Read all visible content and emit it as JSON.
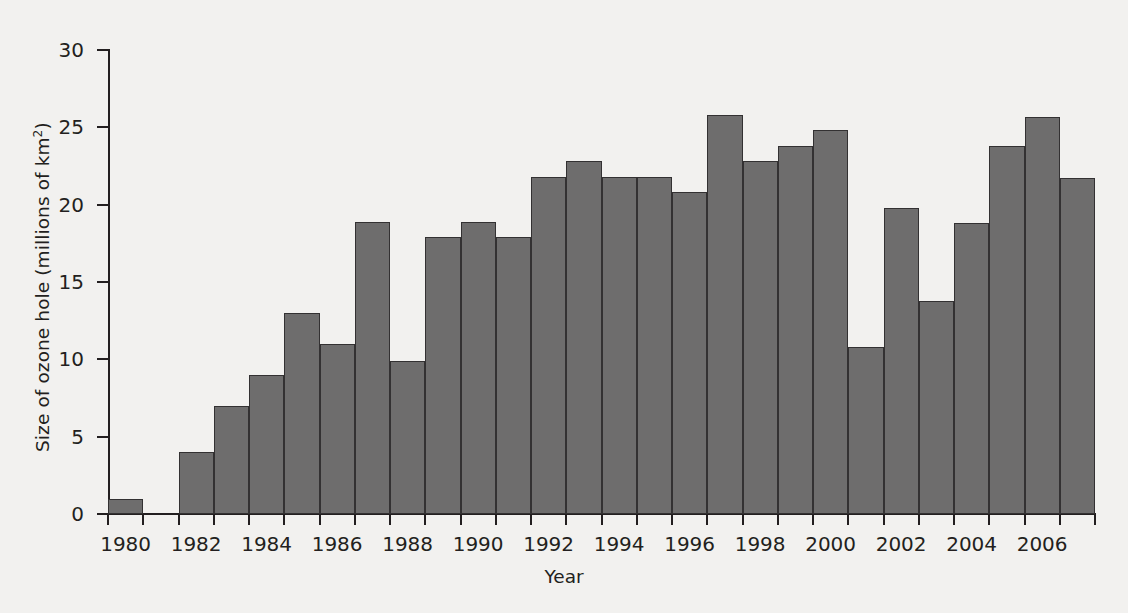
{
  "chart_data": {
    "type": "bar",
    "title": "",
    "xlabel": "Year",
    "ylabel": "Size of ozone hole (millions of km²)",
    "ylabel_main": "Size of ozone hole (millions of km",
    "ylabel_sup": "2",
    "ylabel_tail": ")",
    "categories": [
      1980,
      1981,
      1982,
      1983,
      1984,
      1985,
      1986,
      1987,
      1988,
      1989,
      1990,
      1991,
      1992,
      1993,
      1994,
      1995,
      1996,
      1997,
      1998,
      1999,
      2000,
      2001,
      2002,
      2003,
      2004,
      2005,
      2006,
      2007
    ],
    "values": [
      1.0,
      0,
      4.0,
      7.0,
      9.0,
      13.0,
      11.0,
      18.9,
      9.9,
      17.9,
      18.9,
      17.9,
      21.8,
      22.8,
      21.8,
      21.8,
      20.8,
      25.8,
      22.8,
      23.8,
      24.8,
      10.8,
      19.8,
      13.8,
      18.8,
      23.8,
      25.7,
      21.7
    ],
    "ylim": [
      0,
      30
    ],
    "xlim": [
      1980,
      2008
    ],
    "ytick_values": [
      0,
      5,
      10,
      15,
      20,
      25,
      30
    ],
    "ytick_labels": [
      "0",
      "5",
      "10",
      "15",
      "20",
      "25",
      "30"
    ],
    "xtick_values": [
      1980,
      1982,
      1984,
      1986,
      1988,
      1990,
      1992,
      1994,
      1996,
      1998,
      2000,
      2002,
      2004,
      2006
    ],
    "xtick_labels": [
      "1980",
      "1982",
      "1984",
      "1986",
      "1988",
      "1990",
      "1992",
      "1994",
      "1996",
      "1998",
      "2000",
      "2002",
      "2004",
      "2006"
    ],
    "grid": false,
    "legend": null,
    "bar_color": "#6e6d6d",
    "bar_edge_color": "#333132",
    "background_color": "#f2f1ef",
    "axis_color": "#231f20",
    "note_missing_year": 1981
  }
}
